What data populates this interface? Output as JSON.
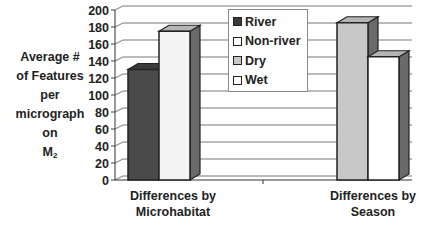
{
  "chart_data": {
    "type": "bar",
    "style": "3d-clustered-column",
    "title": "",
    "ylabel_lines": [
      "Average #",
      "of Features",
      "per",
      "micrograph",
      "on",
      "M"
    ],
    "ylabel_subscript": "2",
    "xlabel": "",
    "ylim": [
      0,
      200
    ],
    "yticks": [
      0,
      20,
      40,
      60,
      80,
      100,
      120,
      140,
      160,
      180,
      200
    ],
    "grid": true,
    "legend_position": "top-center-inside",
    "groups": [
      {
        "category": "Differences by Microhabitat",
        "category_lines": [
          "Differences by",
          "Microhabitat"
        ],
        "series": [
          {
            "name": "River",
            "value": 130,
            "color": "#4a4a4a"
          },
          {
            "name": "Non-river",
            "value": 175,
            "color": "#f4f4f4"
          }
        ]
      },
      {
        "category": "Differences by Season",
        "category_lines": [
          "Differences by",
          "Season"
        ],
        "series": [
          {
            "name": "Dry",
            "value": 185,
            "color": "#c8c8c8"
          },
          {
            "name": "Wet",
            "value": 145,
            "color": "#ffffff"
          }
        ]
      }
    ],
    "legend": [
      {
        "name": "River",
        "color": "#3a3a3a"
      },
      {
        "name": "Non-river",
        "color": "#ffffff"
      },
      {
        "name": "Dry",
        "color": "#c8c8c8"
      },
      {
        "name": "Wet",
        "color": "#ffffff"
      }
    ]
  }
}
